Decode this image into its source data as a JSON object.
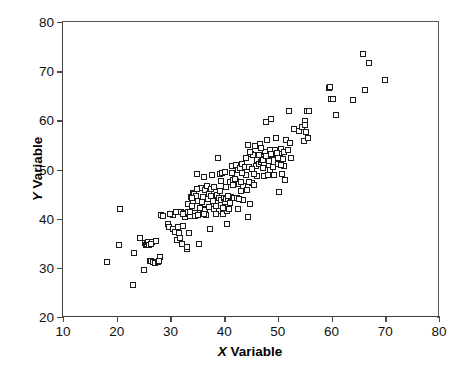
{
  "chart_data": {
    "type": "scatter",
    "title": "",
    "xlabel": "X Variable",
    "ylabel": "Y Variable",
    "xlabel_prefix": "X",
    "xlabel_suffix": " Variable",
    "ylabel_prefix": "Y",
    "ylabel_suffix": " Variable",
    "xlim": [
      10,
      80
    ],
    "ylim": [
      20,
      80
    ],
    "xticks": [
      10,
      20,
      30,
      40,
      50,
      60,
      70,
      80
    ],
    "yticks": [
      20,
      30,
      40,
      50,
      60,
      70,
      80
    ],
    "grid": false,
    "legend": null,
    "marker": "open-square",
    "marker_color": "#1a1a1a",
    "marker_fill": "#ffffff",
    "n_points": 214,
    "points": [
      [
        18.2,
        31.2
      ],
      [
        20.6,
        41.9
      ],
      [
        20.4,
        34.6
      ],
      [
        23.1,
        26.5
      ],
      [
        23.2,
        33.1
      ],
      [
        24.4,
        36.0
      ],
      [
        25.1,
        29.6
      ],
      [
        25.2,
        35.0
      ],
      [
        25.4,
        34.7
      ],
      [
        25.6,
        34.9
      ],
      [
        25.8,
        35.3
      ],
      [
        26.2,
        31.3
      ],
      [
        26.4,
        31.4
      ],
      [
        26.6,
        35.2
      ],
      [
        26.8,
        31.1
      ],
      [
        27.1,
        31.0
      ],
      [
        27.4,
        35.4
      ],
      [
        27.6,
        31.2
      ],
      [
        28.0,
        32.3
      ],
      [
        28.2,
        40.7
      ],
      [
        28.6,
        40.6
      ],
      [
        29.5,
        39.0
      ],
      [
        29.8,
        38.3
      ],
      [
        30.2,
        40.9
      ],
      [
        30.4,
        37.8
      ],
      [
        30.5,
        40.8
      ],
      [
        30.8,
        37.2
      ],
      [
        31.0,
        41.3
      ],
      [
        31.2,
        35.7
      ],
      [
        31.4,
        38.3
      ],
      [
        31.6,
        37.0
      ],
      [
        31.8,
        36.0
      ],
      [
        32.0,
        41.4
      ],
      [
        32.2,
        34.8
      ],
      [
        32.4,
        38.6
      ],
      [
        32.6,
        41.1
      ],
      [
        32.8,
        40.4
      ],
      [
        33.0,
        33.9
      ],
      [
        33.1,
        34.2
      ],
      [
        33.2,
        43.0
      ],
      [
        33.4,
        41.0
      ],
      [
        33.5,
        37.0
      ],
      [
        33.6,
        40.6
      ],
      [
        33.8,
        44.5
      ],
      [
        34.0,
        42.6
      ],
      [
        34.2,
        45.3
      ],
      [
        34.4,
        45.0
      ],
      [
        34.5,
        41.2
      ],
      [
        34.6,
        40.5
      ],
      [
        34.8,
        44.6
      ],
      [
        35.0,
        49.0
      ],
      [
        35.1,
        43.5
      ],
      [
        35.2,
        40.8
      ],
      [
        35.4,
        34.8
      ],
      [
        35.6,
        46.2
      ],
      [
        35.8,
        43.3
      ],
      [
        36.0,
        42.0
      ],
      [
        36.2,
        48.4
      ],
      [
        36.4,
        45.8
      ],
      [
        36.5,
        41.7
      ],
      [
        36.6,
        40.7
      ],
      [
        36.8,
        46.6
      ],
      [
        37.0,
        43.9
      ],
      [
        37.2,
        45.1
      ],
      [
        37.4,
        37.8
      ],
      [
        37.6,
        46.0
      ],
      [
        37.8,
        48.9
      ],
      [
        38.0,
        43.5
      ],
      [
        38.2,
        41.9
      ],
      [
        38.4,
        42.5
      ],
      [
        38.6,
        44.8
      ],
      [
        38.8,
        52.3
      ],
      [
        39.0,
        41.5
      ],
      [
        39.1,
        44.2
      ],
      [
        39.2,
        49.0
      ],
      [
        39.4,
        43.8
      ],
      [
        39.5,
        47.6
      ],
      [
        39.6,
        49.3
      ],
      [
        39.8,
        41.0
      ],
      [
        40.0,
        44.3
      ],
      [
        40.1,
        43.4
      ],
      [
        40.2,
        49.5
      ],
      [
        40.3,
        46.4
      ],
      [
        40.4,
        44.0
      ],
      [
        40.5,
        38.9
      ],
      [
        40.6,
        41.5
      ],
      [
        40.8,
        43.9
      ],
      [
        41.0,
        47.5
      ],
      [
        41.2,
        44.4
      ],
      [
        41.4,
        49.3
      ],
      [
        41.5,
        50.7
      ],
      [
        41.6,
        47.8
      ],
      [
        41.8,
        44.2
      ],
      [
        42.0,
        47.2
      ],
      [
        42.2,
        47.6
      ],
      [
        42.3,
        51.0
      ],
      [
        42.4,
        44.3
      ],
      [
        42.5,
        42.0
      ],
      [
        42.6,
        49.8
      ],
      [
        42.8,
        47.0
      ],
      [
        43.0,
        50.3
      ],
      [
        43.2,
        45.7
      ],
      [
        43.4,
        51.1
      ],
      [
        43.5,
        46.6
      ],
      [
        43.6,
        43.8
      ],
      [
        43.8,
        50.6
      ],
      [
        44.0,
        52.4
      ],
      [
        44.2,
        45.9
      ],
      [
        44.4,
        40.4
      ],
      [
        44.5,
        55.0
      ],
      [
        44.6,
        50.6
      ],
      [
        44.8,
        42.9
      ],
      [
        45.0,
        53.1
      ],
      [
        45.2,
        47.2
      ],
      [
        45.4,
        52.9
      ],
      [
        45.6,
        46.8
      ],
      [
        45.8,
        54.8
      ],
      [
        46.0,
        50.8
      ],
      [
        46.2,
        52.0
      ],
      [
        46.4,
        51.2
      ],
      [
        46.6,
        55.2
      ],
      [
        46.8,
        51.6
      ],
      [
        47.0,
        51.9
      ],
      [
        47.1,
        52.2
      ],
      [
        47.2,
        52.0
      ],
      [
        47.4,
        48.6
      ],
      [
        47.5,
        51.0
      ],
      [
        47.6,
        53.6
      ],
      [
        47.8,
        59.6
      ],
      [
        48.0,
        56.0
      ],
      [
        48.1,
        52.4
      ],
      [
        48.2,
        48.9
      ],
      [
        48.4,
        52.1
      ],
      [
        48.5,
        54.0
      ],
      [
        48.6,
        50.0
      ],
      [
        48.8,
        60.2
      ],
      [
        49.0,
        52.9
      ],
      [
        49.2,
        48.8
      ],
      [
        49.4,
        53.9
      ],
      [
        49.6,
        56.5
      ],
      [
        49.8,
        53.0
      ],
      [
        50.0,
        52.4
      ],
      [
        50.2,
        45.5
      ],
      [
        50.4,
        53.4
      ],
      [
        50.6,
        54.2
      ],
      [
        50.8,
        49.1
      ],
      [
        51.0,
        52.2
      ],
      [
        51.2,
        53.5
      ],
      [
        51.4,
        47.8
      ],
      [
        51.6,
        56.0
      ],
      [
        52.0,
        61.8
      ],
      [
        52.2,
        55.4
      ],
      [
        52.4,
        52.4
      ],
      [
        53.0,
        58.3
      ],
      [
        54.0,
        57.8
      ],
      [
        54.5,
        58.6
      ],
      [
        54.8,
        55.8
      ],
      [
        55.0,
        59.8
      ],
      [
        55.1,
        59.0
      ],
      [
        55.2,
        57.6
      ],
      [
        55.4,
        61.9
      ],
      [
        55.6,
        56.4
      ],
      [
        55.8,
        62.0
      ],
      [
        59.6,
        66.6
      ],
      [
        59.8,
        66.7
      ],
      [
        59.9,
        64.4
      ],
      [
        60.2,
        64.4
      ],
      [
        60.8,
        61.0
      ],
      [
        64.0,
        64.2
      ],
      [
        65.8,
        73.5
      ],
      [
        66.2,
        66.2
      ],
      [
        67.0,
        71.6
      ],
      [
        70.0,
        68.3
      ],
      [
        33.3,
        41.4
      ],
      [
        34.1,
        44.2
      ],
      [
        35.5,
        42.1
      ],
      [
        36.1,
        44.5
      ],
      [
        37.1,
        42.4
      ],
      [
        38.1,
        46.4
      ],
      [
        39.3,
        45.6
      ],
      [
        40.7,
        44.6
      ],
      [
        41.1,
        43.2
      ],
      [
        41.7,
        46.8
      ],
      [
        42.1,
        48.0
      ],
      [
        43.1,
        47.4
      ],
      [
        44.1,
        48.8
      ],
      [
        45.1,
        50.2
      ],
      [
        46.1,
        48.6
      ],
      [
        47.3,
        50.4
      ],
      [
        48.3,
        51.8
      ],
      [
        49.1,
        50.6
      ],
      [
        50.1,
        51.2
      ],
      [
        51.1,
        50.8
      ],
      [
        26.0,
        34.6
      ],
      [
        26.3,
        34.8
      ],
      [
        27.8,
        31.4
      ],
      [
        30.0,
        41.0
      ],
      [
        32.3,
        40.9
      ],
      [
        33.7,
        41.3
      ],
      [
        34.9,
        46.0
      ],
      [
        36.3,
        41.0
      ],
      [
        37.5,
        44.6
      ],
      [
        38.5,
        40.9
      ],
      [
        39.7,
        42.2
      ],
      [
        40.9,
        42.0
      ],
      [
        42.7,
        44.0
      ],
      [
        43.3,
        49.2
      ],
      [
        44.7,
        47.4
      ],
      [
        45.5,
        49.0
      ],
      [
        46.5,
        53.0
      ],
      [
        47.7,
        52.8
      ],
      [
        48.7,
        53.2
      ],
      [
        49.9,
        53.4
      ],
      [
        50.5,
        51.0
      ],
      [
        51.8,
        54.0
      ],
      [
        44.9,
        53.6
      ],
      [
        46.9,
        54.4
      ]
    ]
  }
}
